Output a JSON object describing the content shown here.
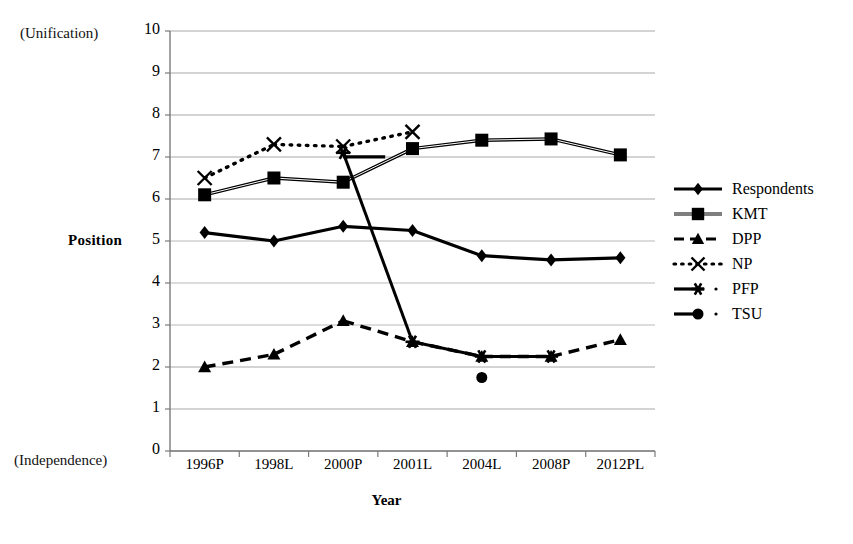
{
  "chart_data": {
    "type": "line",
    "title": "",
    "xlabel": "Year",
    "ylabel": "Position",
    "ylabel_top_note": "(Unification)",
    "ylabel_bottom_note": "(Independence)",
    "categories": [
      "1996P",
      "1998L",
      "2000P",
      "2001L",
      "2004L",
      "2008P",
      "2012PL"
    ],
    "ylim": [
      0,
      10
    ],
    "yticks": [
      0,
      1,
      2,
      3,
      4,
      5,
      6,
      7,
      8,
      9,
      10
    ],
    "grid": "horizontal",
    "legend_position": "right",
    "series": [
      {
        "name": "Respondents",
        "marker": "diamond",
        "line": "solid",
        "values": [
          5.2,
          5.0,
          5.35,
          5.25,
          4.65,
          4.55,
          4.6
        ]
      },
      {
        "name": "KMT",
        "marker": "square",
        "line": "solid-double",
        "values": [
          6.1,
          6.5,
          6.4,
          7.2,
          7.4,
          7.43,
          7.05
        ]
      },
      {
        "name": "DPP",
        "marker": "triangle",
        "line": "dashed",
        "values": [
          2.0,
          2.3,
          3.1,
          2.6,
          2.25,
          2.25,
          2.65
        ]
      },
      {
        "name": "NP",
        "marker": "x",
        "line": "dotted",
        "values": [
          6.5,
          7.3,
          7.25,
          7.6,
          null,
          null,
          null
        ]
      },
      {
        "name": "PFP",
        "marker": "star",
        "line": "solid-short",
        "values": [
          null,
          null,
          7.1,
          2.6,
          2.25,
          2.25,
          null
        ]
      },
      {
        "name": "TSU",
        "marker": "circle",
        "line": "dash-dot",
        "values": [
          null,
          null,
          null,
          null,
          1.75,
          null,
          null
        ]
      }
    ]
  },
  "axis": {
    "y_tick_labels": [
      "10",
      "9",
      "8",
      "7",
      "6",
      "5",
      "4",
      "3",
      "2",
      "1",
      "0"
    ],
    "x_tick_labels": [
      "1996P",
      "1998L",
      "2000P",
      "2001L",
      "2004L",
      "2008P",
      "2012PL"
    ],
    "y_title": "Position",
    "x_title": "Year",
    "top_note": "(Unification)",
    "bottom_note": "(Independence)"
  },
  "legend": {
    "items": [
      {
        "label": "Respondents",
        "icon": "diamond-marker-icon"
      },
      {
        "label": "KMT",
        "icon": "square-marker-icon"
      },
      {
        "label": "DPP",
        "icon": "triangle-marker-icon"
      },
      {
        "label": "NP",
        "icon": "x-marker-icon"
      },
      {
        "label": "PFP",
        "icon": "star-marker-icon"
      },
      {
        "label": "TSU",
        "icon": "circle-marker-icon"
      }
    ]
  },
  "colors": {
    "series": "#000000",
    "grid": "#9a9a9a",
    "axis": "#7a7a7a",
    "background": "#ffffff"
  }
}
